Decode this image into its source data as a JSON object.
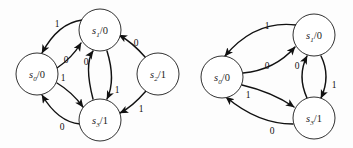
{
  "figure": {
    "background_color": "#fdfdfd",
    "stroke_color": "#111111",
    "node_fill": "#ffffff",
    "diagram_count": 2
  },
  "diagrams": [
    {
      "name": "left-state-diagram",
      "nodes": [
        {
          "id": "s0",
          "state": "s",
          "index": "0",
          "output": "0",
          "label": "s0/0",
          "cx": 37,
          "cy": 74,
          "r": 21
        },
        {
          "id": "s1",
          "state": "s",
          "index": "1",
          "output": "0",
          "label": "s1/0",
          "cx": 100,
          "cy": 30,
          "r": 21
        },
        {
          "id": "s2",
          "state": "s",
          "index": "2",
          "output": "1",
          "label": "s2/1",
          "cx": 158,
          "cy": 74,
          "r": 21
        },
        {
          "id": "s3",
          "state": "s",
          "index": "3",
          "output": "1",
          "label": "s3/1",
          "cx": 100,
          "cy": 120,
          "r": 21
        }
      ],
      "edges": [
        {
          "from": "s1",
          "to": "s0",
          "label": "1",
          "lx": 57,
          "ly": 24
        },
        {
          "from": "s0",
          "to": "s1",
          "label": "0",
          "lx": 66,
          "ly": 60
        },
        {
          "from": "s3",
          "to": "s1",
          "label": "0",
          "lx": 86,
          "ly": 62
        },
        {
          "from": "s0",
          "to": "s3",
          "label": "1",
          "lx": 63,
          "ly": 78
        },
        {
          "from": "s1",
          "to": "s3",
          "label": "1",
          "lx": 116,
          "ly": 90
        },
        {
          "from": "s3",
          "to": "s0",
          "label": "0",
          "lx": 62,
          "ly": 126
        },
        {
          "from": "s2",
          "to": "s1",
          "label": "0",
          "lx": 136,
          "ly": 43
        },
        {
          "from": "s2",
          "to": "s3",
          "label": "1",
          "lx": 140,
          "ly": 108
        }
      ]
    },
    {
      "name": "right-state-diagram",
      "nodes": [
        {
          "id": "s0",
          "state": "s",
          "index": "0",
          "output": "0",
          "label": "s0/0",
          "cx": 222,
          "cy": 77,
          "r": 21
        },
        {
          "id": "s1",
          "state": "s",
          "index": "1",
          "output": "0",
          "label": "s1/0",
          "cx": 314,
          "cy": 35,
          "r": 21
        },
        {
          "id": "s3",
          "state": "s",
          "index": "3",
          "output": "1",
          "label": "s3/1",
          "cx": 314,
          "cy": 118,
          "r": 21
        }
      ],
      "edges": [
        {
          "from": "s1",
          "to": "s0",
          "label": "1",
          "lx": 267,
          "ly": 26
        },
        {
          "from": "s0",
          "to": "s1",
          "label": "0",
          "lx": 267,
          "ly": 66
        },
        {
          "from": "s3",
          "to": "s1",
          "label": "0",
          "lx": 297,
          "ly": 66
        },
        {
          "from": "s1",
          "to": "s3",
          "label": "1",
          "lx": 333,
          "ly": 84
        },
        {
          "from": "s0",
          "to": "s3",
          "label": "1",
          "lx": 248,
          "ly": 94
        },
        {
          "from": "s3",
          "to": "s0",
          "label": "0",
          "lx": 272,
          "ly": 130
        }
      ]
    }
  ]
}
